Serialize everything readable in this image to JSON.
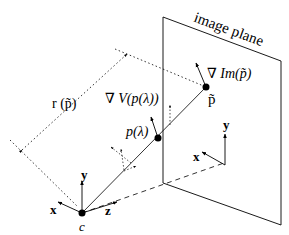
{
  "diagram": {
    "colors": {
      "stroke": "#000000",
      "background": "#ffffff"
    },
    "labels": {
      "image_plane": "image plane",
      "grad_im": "∇ Im(p̃)",
      "p_tilde": "p̃",
      "grad_v": "∇ V(p(λ))",
      "p_lambda": "p(λ)",
      "r_p": "r (p̃)",
      "cam_x": "x",
      "cam_y": "y",
      "cam_z": "z",
      "cam_center": "c",
      "img_x": "x",
      "img_y": "y"
    },
    "nodes": [
      {
        "id": "c",
        "label": "c",
        "x": 82,
        "y": 213
      },
      {
        "id": "p_lambda",
        "label": "p(λ)",
        "x": 158,
        "y": 138
      },
      {
        "id": "p_tilde",
        "label": "p̃",
        "x": 206,
        "y": 87
      }
    ],
    "edges": [
      {
        "from": "c",
        "to": "p_tilde",
        "style": "solid",
        "label": "ray"
      },
      {
        "from": "c",
        "to": "image_plane_origin",
        "style": "dashed",
        "label": "z-axis"
      },
      {
        "from": "r_start",
        "to": "r_end",
        "style": "dotted",
        "label": "r (p̃)"
      }
    ]
  }
}
